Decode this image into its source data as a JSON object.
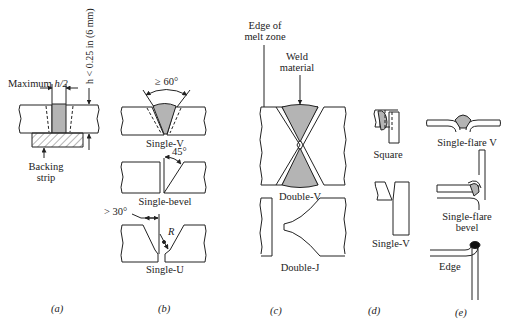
{
  "diagram": {
    "type": "weld-joint-types",
    "colors": {
      "line": "#222222",
      "weld_fill": "#b4b4b4",
      "background": "#ffffff"
    },
    "panels": [
      {
        "id": "a",
        "caption": "(a)",
        "labels": {
          "max": "Maximum h/2",
          "max_prefix": "Maximum ",
          "max_var": "h/2",
          "thickness": "h < 0.25 in (6 mm)",
          "backing_line1": "Backing",
          "backing_line2": "strip"
        }
      },
      {
        "id": "b",
        "caption": "(b)",
        "joints": [
          {
            "name": "Single-V",
            "annotation": "≥ 60°"
          },
          {
            "name": "Single-bevel",
            "annotation": "45°"
          },
          {
            "name": "Single-U",
            "annotation": "> 30°",
            "radius": "R"
          }
        ]
      },
      {
        "id": "c",
        "caption": "(c)",
        "labels": {
          "edge_line1": "Edge of",
          "edge_line2": "melt zone",
          "weld_line1": "Weld",
          "weld_line2": "material"
        },
        "joints": [
          {
            "name": "Double-V"
          },
          {
            "name": "Double-J"
          }
        ]
      },
      {
        "id": "d",
        "caption": "(d)",
        "joints": [
          {
            "name": "Square"
          },
          {
            "name": "Single-V"
          }
        ]
      },
      {
        "id": "e",
        "caption": "(e)",
        "joints": [
          {
            "name": "Single-flare V"
          },
          {
            "name": "Single-flare bevel",
            "line1": "Single-flare",
            "line2": "bevel"
          },
          {
            "name": "Edge"
          }
        ]
      }
    ]
  }
}
